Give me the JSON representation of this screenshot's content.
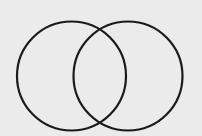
{
  "diagram": {
    "type": "venn",
    "background_color": "#ebebeb",
    "stroke_color": "#1a1a1a",
    "stroke_width": 2.2,
    "circles": [
      {
        "id": "left",
        "cx": 71.5,
        "cy": 76,
        "r": 54.5,
        "label": ""
      },
      {
        "id": "right",
        "cx": 128,
        "cy": 76,
        "r": 54.5,
        "label": ""
      }
    ],
    "labels": []
  }
}
